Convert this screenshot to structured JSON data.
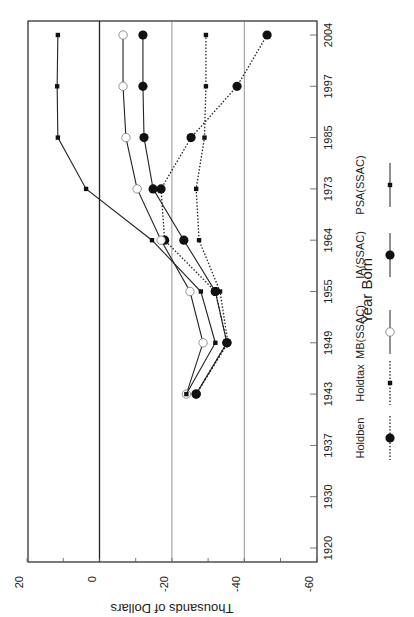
{
  "chart_data": {
    "type": "line",
    "orientation": "rotated 90 degrees clockwise (years run bottom-to-top on right side, dollar axis along bottom)",
    "title": "",
    "xlabel": "Year Born",
    "ylabel": "Thousands of Dollars",
    "categories": [
      "1920",
      "1930",
      "1937",
      "1943",
      "1949",
      "1955",
      "1964",
      "1973",
      "1985",
      "1997",
      "2004"
    ],
    "ylim": [
      -60,
      20
    ],
    "yticks": [
      20,
      0,
      -20,
      -40,
      -60
    ],
    "grid": {
      "major_value_lines": [
        0,
        -20,
        -40
      ],
      "zero_line_emphasized": true
    },
    "legend_position": "bottom-right (rotated)",
    "series": [
      {
        "name": "Holdben",
        "style": "dotted",
        "marker": "filled-circle-large",
        "values": [
          null,
          null,
          null,
          -26.7,
          -35.2,
          -32.0,
          -18.0,
          -17.0,
          -25.3,
          -38.0,
          -46.3
        ]
      },
      {
        "name": "Holdtax",
        "style": "dotted",
        "marker": "small-square",
        "values": [
          null,
          null,
          null,
          -26.7,
          -35.5,
          -33.3,
          -27.5,
          -26.7,
          -29.0,
          -29.4,
          -29.4
        ]
      },
      {
        "name": "MB(SSAC)",
        "style": "solid",
        "marker": "open-circle",
        "values": [
          null,
          null,
          null,
          -24.0,
          -28.6,
          -25.0,
          -17.0,
          -10.4,
          -7.3,
          -6.5,
          -6.5
        ]
      },
      {
        "name": "IA(SSAC)",
        "style": "solid",
        "marker": "filled-circle-large",
        "values": [
          null,
          null,
          null,
          -26.7,
          -35.2,
          -32.0,
          -23.3,
          -14.8,
          -12.3,
          -12.0,
          -12.0
        ]
      },
      {
        "name": "PSA(SSAC)",
        "style": "solid",
        "marker": "small-square",
        "values": [
          null,
          null,
          null,
          -24.0,
          -32.0,
          -28.0,
          -14.5,
          3.7,
          11.5,
          11.7,
          11.5
        ]
      }
    ]
  },
  "axis": {
    "value_tick_labels": [
      "20",
      "0",
      "-20",
      "-40",
      "-60"
    ],
    "value_title": "Thousands of Dollars",
    "year_title": "Year Born"
  },
  "legend": {
    "items": [
      "Holdben",
      "Holdtax",
      "MB(SSAC)",
      "IA(SSAC)",
      "PSA(SSAC)"
    ]
  }
}
